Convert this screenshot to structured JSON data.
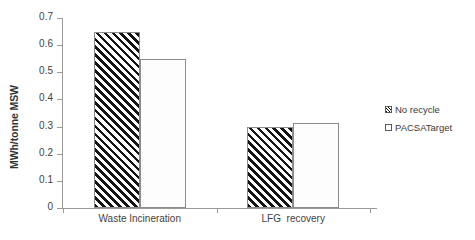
{
  "chart_data": {
    "type": "bar",
    "title": "",
    "subtitle": "",
    "xlabel": "",
    "ylabel": "MWh/tonne MSW",
    "categories": [
      "Waste Incineration",
      "LFG  recovery"
    ],
    "series": [
      {
        "name": "No recycle",
        "values": [
          0.65,
          0.3
        ],
        "pattern": "diagonal-hatch"
      },
      {
        "name": "PACSATarget",
        "values": [
          0.55,
          0.315
        ],
        "pattern": "fine-dots"
      }
    ],
    "ylim": [
      0,
      0.7
    ],
    "ytick_step": 0.1,
    "ytick_labels": [
      "0.7",
      "0.6",
      "0.5",
      "0.4",
      "0.3",
      "0.2",
      "0.1",
      "0"
    ],
    "ytick_values": [
      0.7,
      0.6,
      0.5,
      0.4,
      0.3,
      0.2,
      0.1,
      0
    ],
    "grid": false,
    "legend_position": "right"
  },
  "axis": {
    "y_title": "MWh/tonne MSW"
  },
  "legend": {
    "items": [
      {
        "label": "No recycle"
      },
      {
        "label": "PACSATarget"
      }
    ]
  },
  "colors": {
    "axis": "#9a9a9a",
    "bar_border": "#8c8c8c",
    "hatch_fill": "#141414",
    "dot_fill": "#a8a8a8",
    "text": "#3a3a3a",
    "background": "#ffffff"
  }
}
